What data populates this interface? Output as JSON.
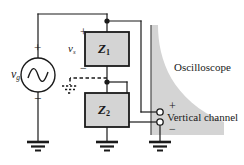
{
  "figure": {
    "type": "circuit-diagram",
    "background_color": "#ffffff",
    "line_color": "#1a1a1a",
    "block_fill_color": "#d4d4d4",
    "scope_fill_color": "#d4d4d4"
  },
  "source": {
    "label": "v",
    "label_sub": "g",
    "plus": "+",
    "minus": "−",
    "symbol": "ac-source"
  },
  "impedance_top": {
    "label": "Z",
    "label_sub": "1",
    "voltage_label": "v",
    "voltage_label_sub": "s",
    "plus": "+",
    "minus": "−"
  },
  "impedance_bottom": {
    "label": "Z",
    "label_sub": "2"
  },
  "oscilloscope": {
    "title": "Oscilloscope",
    "channel_label": "Vertical channel",
    "plus": "+",
    "minus": "−"
  },
  "grounds": [
    {
      "name": "source-ground"
    },
    {
      "name": "divider-reference-ground"
    },
    {
      "name": "impedance-bottom-ground"
    },
    {
      "name": "scope-ground"
    }
  ]
}
